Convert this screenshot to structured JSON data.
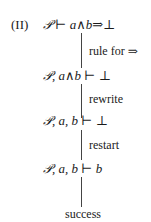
{
  "derivation": {
    "label": "(II)",
    "steps": [
      {
        "formula": {
          "ctx": "𝒫",
          "rest": " ⊢ a∧b⇒⊥"
        }
      },
      {
        "rule": "rule for ⇒"
      },
      {
        "formula": {
          "ctx": "𝒫",
          "rest": ", a∧b ⊢ ⊥"
        }
      },
      {
        "rule": "rewrite"
      },
      {
        "formula": {
          "ctx": "𝒫",
          "rest": ", a, b ⊢ ⊥"
        }
      },
      {
        "rule": "restart"
      },
      {
        "formula": {
          "ctx": "𝒫",
          "rest": ", a, b ⊢ b"
        }
      },
      {
        "rule": ""
      }
    ],
    "result": "success"
  }
}
